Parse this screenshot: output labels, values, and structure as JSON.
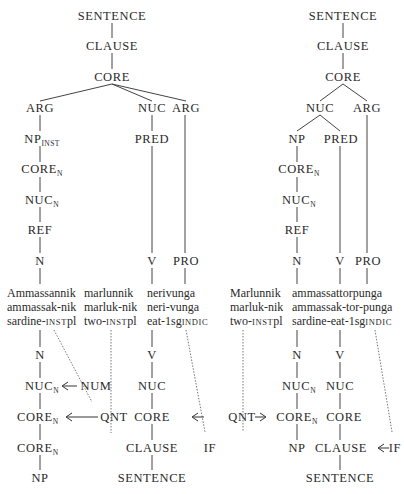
{
  "left_tree": {
    "top": {
      "sentence": "SENTENCE",
      "clause": "CLAUSE",
      "core": "CORE",
      "arg1": "ARG",
      "nuc": "NUC",
      "arg2": "ARG",
      "np": "NP",
      "np_sub": "INST",
      "core_n": "CORE",
      "core_n_sub": "N",
      "nuc_n": "NUC",
      "nuc_n_sub": "N",
      "ref": "REF",
      "n": "N",
      "pred": "PRED",
      "v": "V",
      "pro": "PRO"
    },
    "words": {
      "w1": {
        "line1": "Ammassannik",
        "line2": "ammassak-nik",
        "line3a": "sardine-",
        "line3sc": "INST",
        "line3b": "pl"
      },
      "w2": {
        "line1": "marlunnik",
        "line2": "marluk-nik",
        "line3a": "two-",
        "line3sc": "INST",
        "line3b": "pl"
      },
      "w3": {
        "line1": "nerivunga",
        "line2": "neri-vunga",
        "line3a": "eat-1sg",
        "line3sc": "INDIC",
        "line3b": ""
      }
    },
    "bottom": {
      "n": "N",
      "nuc_n": "NUC",
      "nuc_n_sub": "N",
      "core_n1": "CORE",
      "core_n1_sub": "N",
      "num": "NUM",
      "core_n2": "CORE",
      "core_n2_sub": "N",
      "qnt": "QNT",
      "np": "NP",
      "v": "V",
      "nuc": "NUC",
      "core": "CORE",
      "clause": "CLAUSE",
      "if": "IF",
      "sentence": "SENTENCE"
    }
  },
  "right_tree": {
    "top": {
      "sentence": "SENTENCE",
      "clause": "CLAUSE",
      "core": "CORE",
      "nuc": "NUC",
      "arg": "ARG",
      "np": "NP",
      "pred": "PRED",
      "core_n": "CORE",
      "core_n_sub": "N",
      "nuc_n": "NUC",
      "nuc_n_sub": "N",
      "ref": "REF",
      "n": "N",
      "v": "V",
      "pro": "PRO"
    },
    "words": {
      "w1": {
        "line1": "Marlunnik",
        "line2": "marluk-nik",
        "line3a": "two-",
        "line3sc": "INST",
        "line3b": "pl"
      },
      "w2": {
        "line1": "ammassattorpunga",
        "line2": "ammassak-tor-punga",
        "line3a": "sardine-eat-1sg",
        "line3sc": "INDIC",
        "line3b": ""
      }
    },
    "bottom": {
      "qnt": "QNT",
      "n": "N",
      "nuc_n": "NUC",
      "nuc_n_sub": "N",
      "core_n": "CORE",
      "core_n_sub": "N",
      "np": "NP",
      "v": "V",
      "nuc": "NUC",
      "core": "CORE",
      "clause": "CLAUSE",
      "if": "IF",
      "sentence": "SENTENCE"
    }
  }
}
